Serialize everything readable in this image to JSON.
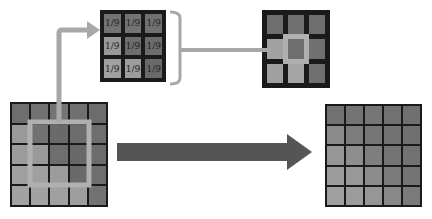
{
  "diagram": {
    "title": "",
    "input_grid": {
      "rows": 5,
      "cols": 5,
      "colors": [
        [
          "#6e6e6e",
          "#727272",
          "#747474",
          "#707070",
          "#6c6c6c"
        ],
        [
          "#9a9a9a",
          "#727272",
          "#6a6a6a",
          "#6c6c6c",
          "#6e6e6e"
        ],
        [
          "#9c9c9c",
          "#9a9a9a",
          "#6e6e6e",
          "#686868",
          "#6c6c6c"
        ],
        [
          "#a0a0a0",
          "#a0a0a0",
          "#9c9c9c",
          "#6a6a6a",
          "#6e6e6e"
        ],
        [
          "#a2a2a2",
          "#a2a2a2",
          "#a0a0a0",
          "#9e9e9e",
          "#727272"
        ]
      ],
      "highlight_color": "#b0b0b0"
    },
    "kernel": {
      "rows": 3,
      "cols": 3,
      "labels": [
        [
          "1/9",
          "1/9",
          "1/9"
        ],
        [
          "1/9",
          "1/9",
          "1/9"
        ],
        [
          "1/9",
          "1/9",
          "1/9"
        ]
      ],
      "colors": [
        [
          "#727272",
          "#747474",
          "#707070"
        ],
        [
          "#9a9a9a",
          "#6e6e6e",
          "#6c6c6c"
        ],
        [
          "#a0a0a0",
          "#9c9c9c",
          "#6a6a6a"
        ]
      ]
    },
    "result_patch": {
      "rows": 3,
      "cols": 3,
      "colors": [
        [
          "#6e6e6e",
          "#707070",
          "#6e6e6e"
        ],
        [
          "#a2a2a2",
          "#6e6e6e",
          "#707070"
        ],
        [
          "#a0a0a0",
          "#a4a4a4",
          "#707070"
        ]
      ],
      "center_highlight": "#b0b0b0"
    },
    "output_grid": {
      "rows": 5,
      "cols": 5,
      "colors": [
        [
          "#727272",
          "#747474",
          "#767676",
          "#727272",
          "#707070"
        ],
        [
          "#8a8a8a",
          "#7c7c7c",
          "#767676",
          "#727272",
          "#707070"
        ],
        [
          "#969696",
          "#8e8e8e",
          "#7e7e7e",
          "#747474",
          "#727272"
        ],
        [
          "#9c9c9c",
          "#989898",
          "#8c8c8c",
          "#7a7a7a",
          "#747474"
        ],
        [
          "#a0a0a0",
          "#9c9c9c",
          "#969696",
          "#888888",
          "#7a7a7a"
        ]
      ]
    },
    "arrow_colors": {
      "light": "#a8a8a8",
      "dark": "#555555"
    }
  }
}
